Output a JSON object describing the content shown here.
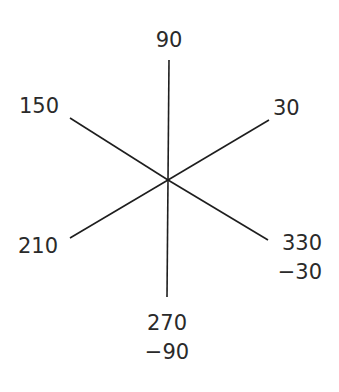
{
  "diagram": {
    "title": "",
    "center": {
      "x": 168,
      "y": 180
    },
    "line_color": "#1e1e1e",
    "text_color": "#2a2a2a",
    "rays": [
      {
        "angle_deg": 90,
        "end": {
          "x": 169,
          "y": 60
        }
      },
      {
        "angle_deg": 30,
        "end": {
          "x": 269,
          "y": 120
        }
      },
      {
        "angle_deg": 150,
        "end": {
          "x": 70,
          "y": 118
        }
      },
      {
        "angle_deg": 210,
        "end": {
          "x": 70,
          "y": 238
        }
      },
      {
        "angle_deg": 330,
        "end": {
          "x": 268,
          "y": 240
        }
      },
      {
        "angle_deg": 270,
        "end": {
          "x": 167,
          "y": 297
        }
      }
    ],
    "labels": {
      "deg90": {
        "lines": [
          "90"
        ]
      },
      "deg30": {
        "lines": [
          "30"
        ]
      },
      "deg150": {
        "lines": [
          "150"
        ]
      },
      "deg210": {
        "lines": [
          "210"
        ]
      },
      "deg330": {
        "lines": [
          "330",
          "−30"
        ]
      },
      "deg270": {
        "lines": [
          "270",
          "−90"
        ]
      }
    }
  }
}
